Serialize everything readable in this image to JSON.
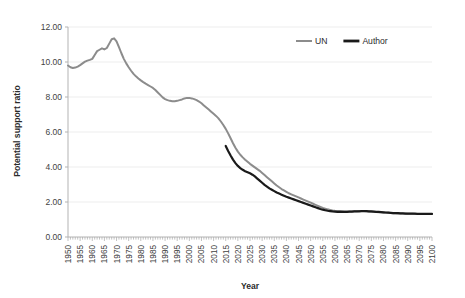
{
  "chart_data": {
    "type": "line",
    "title": "",
    "xlabel": "Year",
    "ylabel": "Potential support ratio",
    "xlim": [
      1950,
      2100
    ],
    "ylim": [
      0,
      12
    ],
    "ytick_step": 2,
    "xtick_step": 5,
    "grid": "horizontal",
    "legend_position": "top-right",
    "ytick_labels": [
      "0.00",
      "2.00",
      "4.00",
      "6.00",
      "8.00",
      "10.00",
      "12.00"
    ],
    "ytick_values": [
      0,
      2,
      4,
      6,
      8,
      10,
      12
    ],
    "xtick_labels": [
      "1950",
      "1955",
      "1960",
      "1965",
      "1970",
      "1975",
      "1980",
      "1985",
      "1990",
      "1995",
      "2000",
      "2005",
      "2010",
      "2015",
      "2020",
      "2025",
      "2030",
      "2035",
      "2040",
      "2045",
      "2050",
      "2055",
      "2060",
      "2065",
      "2070",
      "2075",
      "2080",
      "2085",
      "2090",
      "2095",
      "2100"
    ],
    "xtick_values": [
      1950,
      1955,
      1960,
      1965,
      1970,
      1975,
      1980,
      1985,
      1990,
      1995,
      2000,
      2005,
      2010,
      2015,
      2020,
      2025,
      2030,
      2035,
      2040,
      2045,
      2050,
      2055,
      2060,
      2065,
      2070,
      2075,
      2080,
      2085,
      2090,
      2095,
      2100
    ],
    "series": [
      {
        "name": "UN",
        "color": "#8c8c8c",
        "width": 2.0,
        "x": [
          1950,
          1951,
          1952,
          1953,
          1954,
          1955,
          1956,
          1957,
          1958,
          1959,
          1960,
          1961,
          1962,
          1963,
          1964,
          1965,
          1966,
          1967,
          1968,
          1969,
          1970,
          1971,
          1972,
          1973,
          1974,
          1975,
          1976,
          1977,
          1978,
          1979,
          1980,
          1981,
          1982,
          1983,
          1984,
          1985,
          1986,
          1987,
          1988,
          1989,
          1990,
          1991,
          1992,
          1993,
          1994,
          1995,
          1996,
          1997,
          1998,
          1999,
          2000,
          2001,
          2002,
          2003,
          2004,
          2005,
          2006,
          2007,
          2008,
          2009,
          2010,
          2011,
          2012,
          2013,
          2014,
          2015,
          2016,
          2017,
          2018,
          2019,
          2020,
          2021,
          2022,
          2023,
          2024,
          2025,
          2026,
          2027,
          2028,
          2029,
          2030,
          2031,
          2032,
          2033,
          2034,
          2035,
          2036,
          2037,
          2038,
          2039,
          2040,
          2041,
          2042,
          2043,
          2044,
          2045,
          2046,
          2047,
          2048,
          2049,
          2050,
          2051,
          2052,
          2053,
          2054,
          2055,
          2056,
          2057,
          2058,
          2059,
          2060,
          2061,
          2062,
          2063,
          2064,
          2065,
          2066,
          2067,
          2068,
          2069,
          2070,
          2071,
          2072,
          2073,
          2074,
          2075,
          2076,
          2077,
          2078,
          2079,
          2080,
          2081,
          2082,
          2083,
          2084,
          2085,
          2086,
          2087,
          2088,
          2089,
          2090,
          2091,
          2092,
          2093,
          2094,
          2095,
          2096,
          2097,
          2098,
          2099,
          2100
        ],
        "y": [
          9.8,
          9.7,
          9.66,
          9.68,
          9.74,
          9.82,
          9.92,
          10.02,
          10.08,
          10.12,
          10.18,
          10.4,
          10.62,
          10.7,
          10.78,
          10.72,
          10.8,
          11.05,
          11.3,
          11.35,
          11.18,
          10.85,
          10.5,
          10.18,
          9.92,
          9.7,
          9.5,
          9.32,
          9.18,
          9.06,
          8.95,
          8.85,
          8.76,
          8.68,
          8.6,
          8.52,
          8.4,
          8.26,
          8.12,
          7.98,
          7.88,
          7.82,
          7.78,
          7.76,
          7.76,
          7.78,
          7.82,
          7.86,
          7.92,
          7.95,
          7.95,
          7.92,
          7.88,
          7.82,
          7.74,
          7.64,
          7.52,
          7.4,
          7.28,
          7.16,
          7.04,
          6.92,
          6.78,
          6.6,
          6.4,
          6.18,
          5.92,
          5.64,
          5.36,
          5.1,
          4.88,
          4.7,
          4.55,
          4.42,
          4.3,
          4.18,
          4.08,
          3.98,
          3.88,
          3.78,
          3.66,
          3.54,
          3.42,
          3.3,
          3.18,
          3.06,
          2.94,
          2.84,
          2.74,
          2.66,
          2.58,
          2.5,
          2.44,
          2.38,
          2.32,
          2.26,
          2.2,
          2.14,
          2.08,
          2.02,
          1.96,
          1.9,
          1.84,
          1.78,
          1.72,
          1.66,
          1.62,
          1.58,
          1.55,
          1.52,
          1.5,
          1.49,
          1.48,
          1.47,
          1.46,
          1.46,
          1.46,
          1.46,
          1.47,
          1.47,
          1.48,
          1.48,
          1.48,
          1.47,
          1.46,
          1.45,
          1.44,
          1.43,
          1.42,
          1.41,
          1.4,
          1.39,
          1.38,
          1.37,
          1.36,
          1.36,
          1.35,
          1.35,
          1.34,
          1.34,
          1.33,
          1.33,
          1.33,
          1.32,
          1.32,
          1.32,
          1.32,
          1.32,
          1.32,
          1.32,
          1.32
        ]
      },
      {
        "name": "Author",
        "color": "#1a1a1a",
        "width": 2.2,
        "x": [
          2015,
          2016,
          2017,
          2018,
          2019,
          2020,
          2021,
          2022,
          2023,
          2024,
          2025,
          2026,
          2027,
          2028,
          2029,
          2030,
          2031,
          2032,
          2033,
          2034,
          2035,
          2036,
          2037,
          2038,
          2039,
          2040,
          2041,
          2042,
          2043,
          2044,
          2045,
          2046,
          2047,
          2048,
          2049,
          2050,
          2051,
          2052,
          2053,
          2054,
          2055,
          2056,
          2057,
          2058,
          2059,
          2060,
          2061,
          2062,
          2063,
          2064,
          2065,
          2066,
          2067,
          2068,
          2069,
          2070,
          2071,
          2072,
          2073,
          2074,
          2075,
          2076,
          2077,
          2078,
          2079,
          2080,
          2081,
          2082,
          2083,
          2084,
          2085,
          2086,
          2087,
          2088,
          2089,
          2090,
          2091,
          2092,
          2093,
          2094,
          2095,
          2096,
          2097,
          2098,
          2099,
          2100
        ],
        "y": [
          5.2,
          4.92,
          4.66,
          4.42,
          4.22,
          4.06,
          3.94,
          3.84,
          3.76,
          3.7,
          3.64,
          3.56,
          3.46,
          3.34,
          3.22,
          3.1,
          2.98,
          2.88,
          2.78,
          2.7,
          2.62,
          2.54,
          2.48,
          2.42,
          2.36,
          2.3,
          2.25,
          2.2,
          2.15,
          2.1,
          2.05,
          2.0,
          1.95,
          1.9,
          1.85,
          1.8,
          1.75,
          1.7,
          1.65,
          1.6,
          1.56,
          1.53,
          1.5,
          1.48,
          1.46,
          1.45,
          1.44,
          1.44,
          1.44,
          1.44,
          1.44,
          1.45,
          1.45,
          1.46,
          1.47,
          1.47,
          1.48,
          1.48,
          1.48,
          1.47,
          1.46,
          1.45,
          1.44,
          1.43,
          1.42,
          1.41,
          1.4,
          1.39,
          1.38,
          1.37,
          1.36,
          1.36,
          1.35,
          1.35,
          1.34,
          1.34,
          1.33,
          1.33,
          1.33,
          1.32,
          1.32,
          1.32,
          1.32,
          1.32,
          1.32,
          1.32
        ]
      }
    ],
    "legend": [
      {
        "label": "UN",
        "color": "#8c8c8c",
        "width": 2.0
      },
      {
        "label": "Author",
        "color": "#1a1a1a",
        "width": 2.8
      }
    ]
  }
}
